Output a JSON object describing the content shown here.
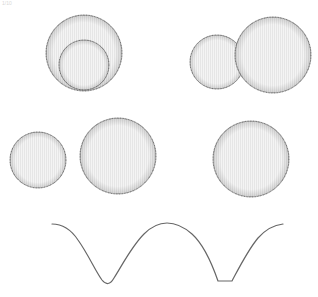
{
  "corner_label": "1/10",
  "colors": {
    "background": "#ffffff",
    "star_fill": "#f4f4f4",
    "star_hatch": "#dcdcdc",
    "star_limb": "#555555",
    "curve": "#666666"
  },
  "panels": [
    {
      "name": "panel-eclipse-total",
      "description": "secondary star passing in front of primary",
      "stars": [
        {
          "cx": 84,
          "cy": 53,
          "r": 38,
          "role": "primary"
        },
        {
          "cx": 84,
          "cy": 65,
          "r": 25,
          "role": "secondary-front"
        }
      ]
    },
    {
      "name": "panel-partial-overlap",
      "description": "stars nearly touching, partial overlap",
      "stars": [
        {
          "cx": 217,
          "cy": 62,
          "r": 27,
          "role": "secondary"
        },
        {
          "cx": 273,
          "cy": 55,
          "r": 38,
          "role": "primary-front"
        }
      ]
    },
    {
      "name": "panel-contact-binary",
      "description": "stars side by side at quadrature",
      "stars": [
        {
          "cx": 38,
          "cy": 160,
          "r": 28,
          "role": "secondary"
        },
        {
          "cx": 118,
          "cy": 156,
          "r": 38,
          "role": "primary"
        }
      ]
    },
    {
      "name": "panel-occultation",
      "description": "secondary hidden behind primary",
      "stars": [
        {
          "cx": 251,
          "cy": 159,
          "r": 38,
          "role": "primary-front"
        }
      ]
    }
  ],
  "light_curve": {
    "path": "M52,224 C62,224 70,228 78,240 C88,254 96,272 102,280 C106,285 110,285 114,278 C124,262 132,246 144,234 C152,226 160,223 167,223 C176,223 184,227 192,234 C202,243 210,258 218,281 L232,281 C240,266 248,250 258,238 C266,229 274,225 283,224"
  }
}
